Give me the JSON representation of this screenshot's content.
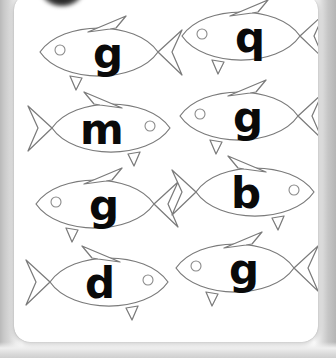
{
  "worksheet": {
    "title": "Letter fish worksheet card",
    "card_color": "#ffffff",
    "backdrop_color": "#c6c6c6",
    "outline_color": "#7b7b7b",
    "letter_color": "#0a0a0a",
    "columns": 2,
    "rows": 4,
    "fish": [
      {
        "letter": "g",
        "facing": "left",
        "col": 0,
        "row": 0,
        "x": 18,
        "y": 18
      },
      {
        "letter": "q",
        "facing": "left",
        "col": 1,
        "row": 0,
        "x": 160,
        "y": 2
      },
      {
        "letter": "m",
        "facing": "right",
        "col": 0,
        "row": 1,
        "x": 12,
        "y": 94
      },
      {
        "letter": "g",
        "facing": "left",
        "col": 1,
        "row": 1,
        "x": 158,
        "y": 82
      },
      {
        "letter": "g",
        "facing": "left",
        "col": 0,
        "row": 2,
        "x": 14,
        "y": 170
      },
      {
        "letter": "b",
        "facing": "right",
        "col": 1,
        "row": 2,
        "x": 156,
        "y": 158
      },
      {
        "letter": "d",
        "facing": "right",
        "col": 0,
        "row": 3,
        "x": 10,
        "y": 248
      },
      {
        "letter": "g",
        "facing": "left",
        "col": 1,
        "row": 3,
        "x": 154,
        "y": 234
      }
    ]
  }
}
